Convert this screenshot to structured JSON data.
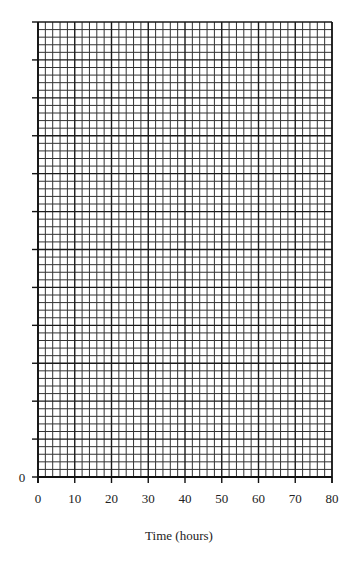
{
  "chart_data": {
    "type": "line",
    "title": "",
    "xlabel": "Time (hours)",
    "ylabel": "",
    "x_ticks": [
      0,
      10,
      20,
      30,
      40,
      50,
      60,
      70,
      80
    ],
    "y_tick_labels": [
      "0"
    ],
    "y_tick_count": 12,
    "xlim": [
      0,
      80
    ],
    "grid": true,
    "minor_divisions_per_x_major": 5,
    "minor_divisions_per_y_tick": 5,
    "series": [],
    "legend": null
  },
  "layout": {
    "plot_left": 38,
    "plot_right": 332,
    "plot_top": 22,
    "plot_bottom": 477,
    "grid_color": "#333333",
    "major_color": "#1a1a1a"
  }
}
